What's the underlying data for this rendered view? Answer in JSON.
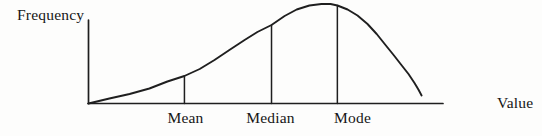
{
  "colors": {
    "ink": "#1f1f1f",
    "background": "#fdfdfc"
  },
  "chart_data": {
    "type": "line",
    "title": "",
    "xlabel": "Value",
    "ylabel": "Frequency",
    "grid": false,
    "axis_numeric_ticks": false,
    "curve_shape": "negatively-skewed frequency distribution",
    "curve": [
      [
        0.0,
        0.0
      ],
      [
        0.059,
        0.05
      ],
      [
        0.116,
        0.095
      ],
      [
        0.172,
        0.151
      ],
      [
        0.223,
        0.221
      ],
      [
        0.271,
        0.276
      ],
      [
        0.314,
        0.347
      ],
      [
        0.356,
        0.437
      ],
      [
        0.398,
        0.538
      ],
      [
        0.441,
        0.638
      ],
      [
        0.477,
        0.719
      ],
      [
        0.517,
        0.789
      ],
      [
        0.554,
        0.879
      ],
      [
        0.588,
        0.945
      ],
      [
        0.624,
        0.985
      ],
      [
        0.658,
        1.0
      ],
      [
        0.684,
        1.0
      ],
      [
        0.703,
        0.985
      ],
      [
        0.732,
        0.945
      ],
      [
        0.76,
        0.884
      ],
      [
        0.788,
        0.799
      ],
      [
        0.814,
        0.698
      ],
      [
        0.839,
        0.588
      ],
      [
        0.862,
        0.487
      ],
      [
        0.884,
        0.387
      ],
      [
        0.904,
        0.296
      ],
      [
        0.921,
        0.206
      ],
      [
        0.932,
        0.141
      ],
      [
        0.941,
        0.08
      ]
    ],
    "markers": [
      {
        "id": "mean",
        "label": "Mean",
        "x": 0.271,
        "height": 0.276,
        "label_x": 0.274
      },
      {
        "id": "median",
        "label": "Median",
        "x": 0.517,
        "height": 0.789,
        "label_x": 0.514
      },
      {
        "id": "mode",
        "label": "Mode",
        "x": 0.703,
        "height": 0.985,
        "label_x": 0.746
      }
    ]
  }
}
